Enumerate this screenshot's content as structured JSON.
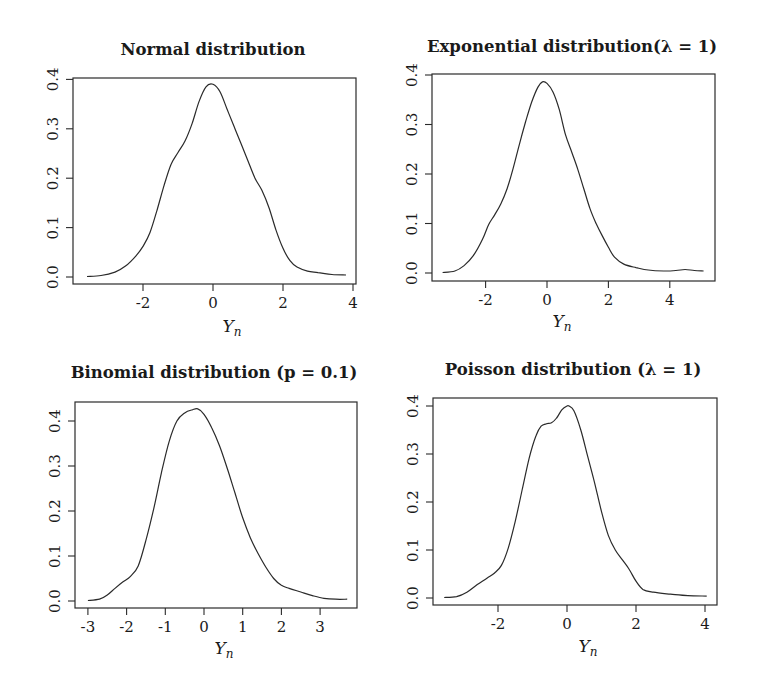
{
  "figure": {
    "panels": [
      {
        "id": "normal",
        "title": "Normal distribution",
        "xlabel": "Y",
        "xlabel_sub": "n"
      },
      {
        "id": "exponential",
        "title": "Exponential distribution(λ = 1)",
        "xlabel": "Y",
        "xlabel_sub": "n"
      },
      {
        "id": "binomial",
        "title": "Binomial distribution (p = 0.1)",
        "xlabel": "Y",
        "xlabel_sub": "n"
      },
      {
        "id": "poisson",
        "title": "Poisson distribution (λ = 1)",
        "xlabel": "Y",
        "xlabel_sub": "n"
      }
    ]
  },
  "chart_data": [
    {
      "type": "line",
      "title": "Normal distribution",
      "xlabel": "Y_n",
      "ylabel": "",
      "xticks": [
        "-2",
        "0",
        "2",
        "4"
      ],
      "yticks": [
        "0.0",
        "0.1",
        "0.2",
        "0.3",
        "0.4"
      ],
      "xlim": [
        -3.9,
        4.2
      ],
      "ylim": [
        -0.015,
        0.405
      ],
      "grid": false,
      "layout": {
        "box": [
          73,
          78,
          356,
          284
        ],
        "x0px": 213,
        "xpx_per_unit": 35,
        "y0px": 277,
        "ypx_per_unit": 494,
        "title_x": 213,
        "title_y": 55,
        "label_x": 232,
        "label_y": 332
      },
      "series": [
        {
          "name": "density",
          "x": [
            -3.6,
            -3.2,
            -2.8,
            -2.5,
            -2.2,
            -2.0,
            -1.8,
            -1.6,
            -1.4,
            -1.2,
            -1.0,
            -0.8,
            -0.6,
            -0.4,
            -0.2,
            0.0,
            0.2,
            0.4,
            0.6,
            0.8,
            1.0,
            1.2,
            1.4,
            1.6,
            1.8,
            2.0,
            2.2,
            2.4,
            2.7,
            3.0,
            3.4,
            3.8
          ],
          "y": [
            0.001,
            0.003,
            0.01,
            0.022,
            0.043,
            0.062,
            0.09,
            0.135,
            0.185,
            0.228,
            0.252,
            0.275,
            0.31,
            0.355,
            0.385,
            0.39,
            0.375,
            0.34,
            0.305,
            0.27,
            0.235,
            0.2,
            0.175,
            0.14,
            0.095,
            0.058,
            0.033,
            0.02,
            0.012,
            0.009,
            0.005,
            0.004
          ]
        }
      ]
    },
    {
      "type": "line",
      "title": "Exponential distribution(λ = 1)",
      "xlabel": "Y_n",
      "ylabel": "",
      "xticks": [
        "-2",
        "0",
        "2",
        "4"
      ],
      "yticks": [
        "0.0",
        "0.1",
        "0.2",
        "0.3",
        "0.4"
      ],
      "xlim": [
        -3.7,
        5.5
      ],
      "ylim": [
        -0.015,
        0.405
      ],
      "grid": false,
      "layout": {
        "box": [
          432,
          74,
          715,
          281
        ],
        "x0px": 547,
        "xpx_per_unit": 30.7,
        "y0px": 273,
        "ypx_per_unit": 495,
        "title_x": 572,
        "title_y": 52,
        "label_x": 562,
        "label_y": 327
      },
      "series": [
        {
          "name": "density",
          "x": [
            -3.4,
            -3.0,
            -2.7,
            -2.4,
            -2.1,
            -1.9,
            -1.7,
            -1.5,
            -1.3,
            -1.1,
            -0.9,
            -0.7,
            -0.5,
            -0.3,
            -0.15,
            0.0,
            0.2,
            0.4,
            0.6,
            0.8,
            1.0,
            1.2,
            1.4,
            1.6,
            1.8,
            2.0,
            2.2,
            2.5,
            2.9,
            3.3,
            3.8,
            4.2,
            4.5,
            4.8,
            5.1
          ],
          "y": [
            0.001,
            0.004,
            0.015,
            0.035,
            0.068,
            0.098,
            0.118,
            0.14,
            0.17,
            0.212,
            0.26,
            0.305,
            0.345,
            0.375,
            0.386,
            0.383,
            0.365,
            0.33,
            0.28,
            0.245,
            0.21,
            0.17,
            0.13,
            0.1,
            0.075,
            0.052,
            0.032,
            0.018,
            0.011,
            0.006,
            0.004,
            0.005,
            0.007,
            0.005,
            0.004
          ]
        }
      ]
    },
    {
      "type": "line",
      "title": "Binomial distribution (p = 0.1)",
      "xlabel": "Y_n",
      "ylabel": "",
      "xticks": [
        "-3",
        "-2",
        "-1",
        "0",
        "1",
        "2",
        "3"
      ],
      "yticks": [
        "0.0",
        "0.1",
        "0.2",
        "0.3",
        "0.4"
      ],
      "xlim": [
        -3.35,
        3.98
      ],
      "ylim": [
        -0.015,
        0.445
      ],
      "grid": false,
      "layout": {
        "box": [
          75,
          402,
          357,
          608
        ],
        "x0px": 204,
        "xpx_per_unit": 38.7,
        "y0px": 601,
        "ypx_per_unit": 450,
        "title_x": 214,
        "title_y": 378,
        "label_x": 224,
        "label_y": 654
      },
      "series": [
        {
          "name": "density",
          "x": [
            -3.0,
            -2.7,
            -2.5,
            -2.3,
            -2.1,
            -1.9,
            -1.7,
            -1.5,
            -1.3,
            -1.1,
            -0.9,
            -0.7,
            -0.5,
            -0.3,
            -0.16,
            0.0,
            0.2,
            0.4,
            0.6,
            0.8,
            1.0,
            1.2,
            1.4,
            1.6,
            1.8,
            2.0,
            2.2,
            2.5,
            2.8,
            3.1,
            3.4,
            3.7
          ],
          "y": [
            0.001,
            0.004,
            0.013,
            0.028,
            0.042,
            0.055,
            0.078,
            0.135,
            0.205,
            0.285,
            0.355,
            0.4,
            0.418,
            0.425,
            0.427,
            0.415,
            0.385,
            0.345,
            0.295,
            0.24,
            0.185,
            0.14,
            0.105,
            0.075,
            0.05,
            0.035,
            0.028,
            0.02,
            0.012,
            0.006,
            0.004,
            0.004
          ]
        }
      ]
    },
    {
      "type": "line",
      "title": "Poisson distribution (λ = 1)",
      "xlabel": "Y_n",
      "ylabel": "",
      "xticks": [
        "-2",
        "0",
        "2",
        "4"
      ],
      "yticks": [
        "0.0",
        "0.1",
        "0.2",
        "0.3",
        "0.4"
      ],
      "xlim": [
        -3.9,
        4.4
      ],
      "ylim": [
        -0.015,
        0.415
      ],
      "grid": false,
      "layout": {
        "box": [
          433,
          398,
          717,
          605
        ],
        "x0px": 567,
        "xpx_per_unit": 34.5,
        "y0px": 598,
        "ypx_per_unit": 480,
        "title_x": 573,
        "title_y": 375,
        "label_x": 588,
        "label_y": 652
      },
      "series": [
        {
          "name": "density",
          "x": [
            -3.56,
            -3.2,
            -2.9,
            -2.6,
            -2.3,
            -2.1,
            -1.9,
            -1.7,
            -1.5,
            -1.3,
            -1.1,
            -0.9,
            -0.75,
            -0.6,
            -0.45,
            -0.3,
            -0.15,
            0.0,
            0.06,
            0.2,
            0.4,
            0.6,
            0.8,
            1.0,
            1.2,
            1.4,
            1.6,
            1.8,
            2.0,
            2.2,
            2.5,
            3.0,
            3.5,
            4.05
          ],
          "y": [
            0.001,
            0.003,
            0.012,
            0.028,
            0.042,
            0.052,
            0.068,
            0.105,
            0.16,
            0.225,
            0.29,
            0.338,
            0.358,
            0.363,
            0.365,
            0.375,
            0.392,
            0.4,
            0.4,
            0.39,
            0.35,
            0.295,
            0.24,
            0.18,
            0.13,
            0.1,
            0.08,
            0.06,
            0.035,
            0.018,
            0.012,
            0.008,
            0.005,
            0.004
          ]
        }
      ]
    }
  ]
}
